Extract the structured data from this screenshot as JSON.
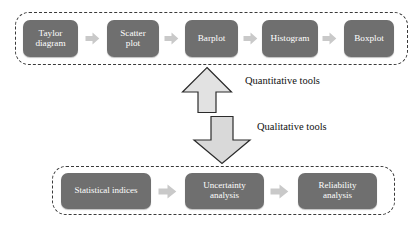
{
  "diagram": {
    "colors": {
      "node_fill": "#6f6f6f",
      "node_text": "#ffffff",
      "connector_arrow": "#c9c9c9",
      "big_arrow_fill": "#e2e2e2",
      "big_arrow_stroke": "#2b2b2b",
      "group_border": "#3a3a3a",
      "background": "#ffffff",
      "label_text": "#111111"
    },
    "groups": [
      {
        "id": "quantitative-group",
        "label": "Quantitative tools",
        "nodes": [
          {
            "id": "taylor-diagram",
            "label": "Taylor\ndiagram"
          },
          {
            "id": "scatter-plot",
            "label": "Scatter\nplot"
          },
          {
            "id": "barplot",
            "label": "Barplot"
          },
          {
            "id": "histogram",
            "label": "Histogram"
          },
          {
            "id": "boxplot",
            "label": "Boxplot"
          }
        ],
        "connector_icons": [
          "right-arrow-icon",
          "right-arrow-icon",
          "right-arrow-icon",
          "right-arrow-icon"
        ]
      },
      {
        "id": "qualitative-group",
        "label": "Qualitative tools",
        "nodes": [
          {
            "id": "statistical-indices",
            "label": "Statistical indices"
          },
          {
            "id": "uncertainty-analysis",
            "label": "Uncertainty\nanalysis"
          },
          {
            "id": "reliability-analysis",
            "label": "Reliability\nanalysis"
          }
        ],
        "connector_icons": [
          "right-arrow-icon",
          "right-arrow-icon"
        ]
      }
    ],
    "flow_labels": {
      "up": "Quantitative tools",
      "down": "Qualitative tools"
    },
    "flow_icons": {
      "up": "up-arrow-icon",
      "down": "down-arrow-icon"
    }
  }
}
